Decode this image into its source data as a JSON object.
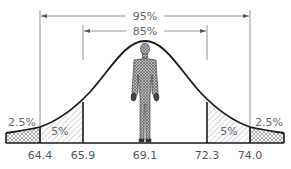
{
  "diagram": {
    "type": "normal-distribution-percentile",
    "brackets": {
      "outer": {
        "label": "95%"
      },
      "inner": {
        "label": "85%"
      }
    },
    "tails": {
      "left_outer": "2.5%",
      "left_inner": "5%",
      "right_inner": "5%",
      "right_outer": "2.5%"
    },
    "axis_values": [
      "64.4",
      "65.9",
      "69.1",
      "72.3",
      "74.0"
    ],
    "figure": "human-figure-icon",
    "colors": {
      "line": "#1a1a1a",
      "dimension_line": "#777777",
      "text": "#555555"
    }
  }
}
